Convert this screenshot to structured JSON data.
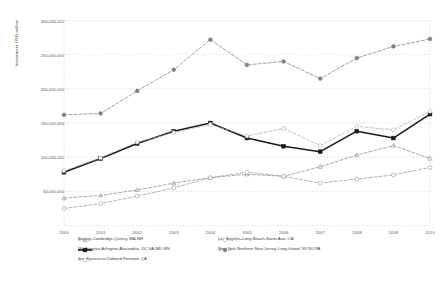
{
  "chart_data": {
    "type": "line",
    "title": "",
    "xlabel": "",
    "ylabel": "Investment USD million",
    "categories": [
      "2000",
      "2001",
      "2002",
      "2003",
      "2004",
      "2005",
      "2006",
      "2007",
      "2008",
      "2009",
      "2010"
    ],
    "ylim": [
      0,
      300000000
    ],
    "ytick_labels": [
      "300,000,000",
      "250,000,000",
      "200,000,000",
      "150,000,000",
      "100,000,000",
      "50,000,000"
    ],
    "ytick_values": [
      300000000,
      250000000,
      200000000,
      150000000,
      100000000,
      50000000
    ],
    "grid": true,
    "legend_position": "bottom",
    "series": [
      {
        "name": "Boston-Cambridge-Quincy, MA-NH",
        "color": "#8c8c8c",
        "style": "dashed",
        "marker": "triangle",
        "values": [
          40000000,
          44000000,
          52000000,
          62000000,
          70000000,
          75000000,
          72000000,
          86000000,
          103000000,
          117000000,
          98000000
        ]
      },
      {
        "name": "Washington-Arlington-Alexandria, DC-VA-MD-WV",
        "color": "#1a1a1a",
        "style": "solid",
        "marker": "square",
        "values": [
          78000000,
          98000000,
          120000000,
          138000000,
          150000000,
          128000000,
          116000000,
          108000000,
          138000000,
          128000000,
          163000000
        ]
      },
      {
        "name": "Los Angeles-Long Beach-Santa Ana, CA",
        "color": "#b0b0b0",
        "style": "dashed",
        "marker": "circle-open",
        "values": [
          80000000,
          99000000,
          122000000,
          136000000,
          148000000,
          131000000,
          142000000,
          117000000,
          145000000,
          140000000,
          167000000
        ]
      },
      {
        "name": "New York-Northern New Jersey-Long Island, NY-NJ-PA",
        "color": "#7f7f7f",
        "style": "dashed",
        "marker": "circle-filled",
        "values": [
          162000000,
          164000000,
          197000000,
          228000000,
          272000000,
          235000000,
          240000000,
          215000000,
          245000000,
          262000000,
          273000000
        ]
      },
      {
        "name": "San Francisco-Oakland-Fremont, CA",
        "color": "#9a9a9a",
        "style": "dashed",
        "marker": "circle-open",
        "values": [
          25000000,
          32000000,
          43000000,
          55000000,
          70000000,
          78000000,
          72000000,
          62000000,
          68000000,
          74000000,
          85000000
        ]
      }
    ]
  }
}
